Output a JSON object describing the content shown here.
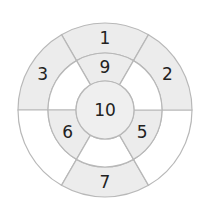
{
  "diagram": {
    "type": "concentric-ring-puzzle",
    "center": {
      "x": 105,
      "y": 110
    },
    "radii": {
      "outer": 87,
      "middle": 57,
      "inner": 29
    },
    "colors": {
      "shaded": "#ececec",
      "white": "#ffffff",
      "center": "#efefef",
      "stroke": "#b8b8b8",
      "text": "#222222"
    },
    "outer_ring": [
      {
        "label": "1",
        "start": 60,
        "end": 120,
        "shaded": true
      },
      {
        "label": "3",
        "start": 120,
        "end": 180,
        "shaded": true
      },
      {
        "label": "",
        "start": 180,
        "end": 240,
        "shaded": false
      },
      {
        "label": "7",
        "start": 240,
        "end": 300,
        "shaded": true
      },
      {
        "label": "",
        "start": 300,
        "end": 360,
        "shaded": false
      },
      {
        "label": "2",
        "start": 0,
        "end": 60,
        "shaded": true
      }
    ],
    "middle_ring": [
      {
        "label": "9",
        "start": 60,
        "end": 120,
        "shaded": true
      },
      {
        "label": "",
        "start": 120,
        "end": 180,
        "shaded": false
      },
      {
        "label": "6",
        "start": 180,
        "end": 240,
        "shaded": true
      },
      {
        "label": "",
        "start": 240,
        "end": 300,
        "shaded": false
      },
      {
        "label": "5",
        "start": 300,
        "end": 360,
        "shaded": true
      },
      {
        "label": "",
        "start": 0,
        "end": 60,
        "shaded": false
      }
    ],
    "center_label": "10"
  }
}
